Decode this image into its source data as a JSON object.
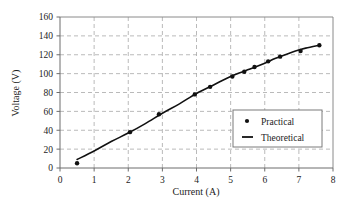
{
  "chart_data": {
    "type": "scatter",
    "title": "",
    "xlabel": "Current (A)",
    "ylabel": "Voltage (V)",
    "xlim": [
      0,
      8
    ],
    "ylim": [
      0,
      160
    ],
    "xticks": [
      0,
      1,
      2,
      3,
      4,
      5,
      6,
      7,
      8
    ],
    "yticks": [
      0,
      20,
      40,
      60,
      80,
      100,
      120,
      140,
      160
    ],
    "xtick_labels": [
      "0",
      "1",
      "2",
      "3",
      "4",
      "5",
      "6",
      "7",
      "8"
    ],
    "ytick_labels": [
      "0",
      "20",
      "40",
      "60",
      "80",
      "100",
      "120",
      "140",
      "160"
    ],
    "grid": true,
    "grid_style": "dashed",
    "grid_color": "#a8a8a8",
    "legend_position": "lower right",
    "series": [
      {
        "name": "Practical",
        "type": "scatter",
        "marker": "dot",
        "color": "#111111",
        "points": [
          [
            0.5,
            5
          ],
          [
            2.05,
            38
          ],
          [
            2.9,
            57
          ],
          [
            3.95,
            78
          ],
          [
            4.4,
            86
          ],
          [
            5.05,
            97
          ],
          [
            5.4,
            102
          ],
          [
            5.7,
            107
          ],
          [
            6.1,
            113
          ],
          [
            6.45,
            118
          ],
          [
            7.05,
            124
          ],
          [
            7.6,
            130
          ]
        ]
      },
      {
        "name": "Theoretical",
        "type": "line",
        "color": "#111111",
        "points": [
          [
            0.5,
            9
          ],
          [
            1.0,
            18
          ],
          [
            1.5,
            28
          ],
          [
            2.0,
            37
          ],
          [
            2.5,
            47
          ],
          [
            3.0,
            58
          ],
          [
            3.5,
            68
          ],
          [
            4.0,
            79
          ],
          [
            4.5,
            88
          ],
          [
            5.0,
            97
          ],
          [
            5.5,
            104
          ],
          [
            6.0,
            111
          ],
          [
            6.3,
            116
          ],
          [
            6.6,
            120
          ],
          [
            6.9,
            124
          ],
          [
            7.2,
            127
          ],
          [
            7.6,
            130
          ]
        ]
      }
    ]
  },
  "legend": {
    "entries": [
      {
        "label": "Practical",
        "glyph": "dot-marker-icon"
      },
      {
        "label": "Theoretical",
        "glyph": "line-marker-icon"
      }
    ]
  }
}
